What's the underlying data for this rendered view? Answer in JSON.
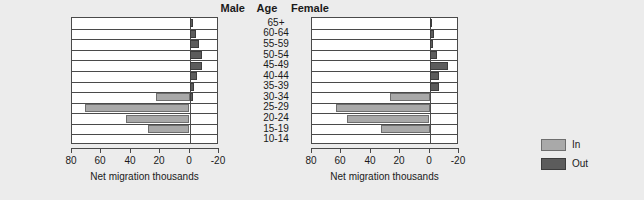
{
  "headers": {
    "male": "Male",
    "age": "Age",
    "female": "Female"
  },
  "legend": {
    "items": [
      {
        "label": "In",
        "color": "#a9a9a9"
      },
      {
        "label": "Out",
        "color": "#5c5c5c"
      }
    ]
  },
  "chart_data": {
    "type": "bar",
    "title": "",
    "orientation": "horizontal",
    "layout": "back-to-back population migration pyramid",
    "xlabel": "Net migration thousands",
    "ylabel": "Age",
    "xlim": [
      80,
      -20
    ],
    "xticks": [
      80,
      60,
      40,
      20,
      0,
      -20
    ],
    "xticklabels": [
      "80",
      "60",
      "40",
      "20",
      "0",
      "-20"
    ],
    "x_axis_reversed": true,
    "grid": false,
    "legend_position": "right",
    "categories": [
      "65+",
      "60-64",
      "55-59",
      "50-54",
      "45-49",
      "40-44",
      "35-39",
      "30-34",
      "25-29",
      "20-24",
      "15-19",
      "10-14"
    ],
    "panels": [
      {
        "name": "Male",
        "xlabel": "Net migration thousands",
        "series": [
          {
            "name": "In",
            "color": "#a9a9a9",
            "values": [
              0,
              0,
              0,
              0,
              0,
              0,
              0,
              23,
              71,
              43,
              28,
              0
            ]
          },
          {
            "name": "Out",
            "color": "#5c5c5c",
            "values": [
              2,
              4,
              6,
              8,
              8,
              5,
              3,
              2,
              0,
              0,
              0,
              0
            ]
          }
        ]
      },
      {
        "name": "Female",
        "xlabel": "Net migration thousands",
        "series": [
          {
            "name": "In",
            "color": "#a9a9a9",
            "values": [
              0,
              0,
              0,
              0,
              0,
              0,
              0,
              27,
              64,
              56,
              33,
              0
            ]
          },
          {
            "name": "Out",
            "color": "#5c5c5c",
            "values": [
              1,
              3,
              2,
              5,
              12,
              6,
              6,
              0,
              0,
              0,
              0,
              0
            ]
          }
        ]
      }
    ]
  }
}
